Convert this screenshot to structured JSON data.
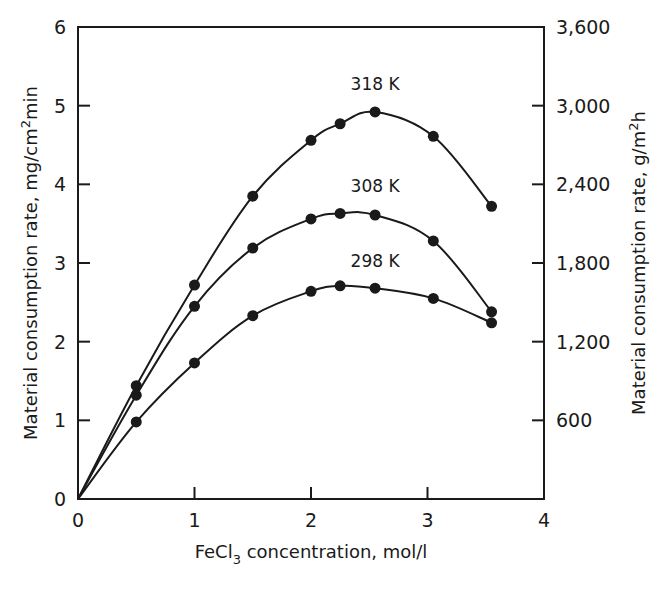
{
  "chart_data": {
    "type": "line",
    "title": "",
    "xlabel": "FeCl3 concentration, mol/l",
    "xlabel_parts": {
      "pre": "FeCl",
      "sub": "3",
      "post": " concentration, mol/l"
    },
    "ylabel": "Material consumption rate, mg/cm2min",
    "ylabel_parts": {
      "pre": "Material consumption rate, mg/cm",
      "sup": "2",
      "post": "min"
    },
    "y2label": "Material consumption rate, g/m2h",
    "y2label_parts": {
      "pre": "Material consumption rate, g/m",
      "sup": "2",
      "post": "h"
    },
    "xlim": [
      0,
      4
    ],
    "ylim": [
      0,
      6
    ],
    "y2lim": [
      0,
      3600
    ],
    "xticks": [
      "0",
      "1",
      "2",
      "3",
      "4"
    ],
    "yticks": [
      "0",
      "1",
      "2",
      "3",
      "4",
      "5",
      "6"
    ],
    "y2ticks": [
      "600",
      "1,200",
      "1,800",
      "2,400",
      "3,000",
      "3,600"
    ],
    "grid": false,
    "legend": "inline labels above curves",
    "series": [
      {
        "name": "318 K",
        "x": [
          0,
          0.5,
          1.0,
          1.5,
          2.0,
          2.25,
          2.55,
          3.05,
          3.55
        ],
        "values": [
          0,
          1.44,
          2.72,
          3.85,
          4.56,
          4.77,
          4.92,
          4.61,
          3.72
        ],
        "label_pos": [
          2.55,
          5.2
        ]
      },
      {
        "name": "308 K",
        "x": [
          0,
          0.5,
          1.0,
          1.5,
          2.0,
          2.25,
          2.55,
          3.05,
          3.55
        ],
        "values": [
          0,
          1.32,
          2.45,
          3.19,
          3.56,
          3.63,
          3.61,
          3.28,
          2.38
        ],
        "label_pos": [
          2.55,
          3.9
        ]
      },
      {
        "name": "298 K",
        "x": [
          0,
          0.5,
          1.0,
          1.5,
          2.0,
          2.25,
          2.55,
          3.05,
          3.55
        ],
        "values": [
          0,
          0.98,
          1.73,
          2.33,
          2.64,
          2.71,
          2.68,
          2.55,
          2.24
        ],
        "label_pos": [
          2.55,
          2.95
        ]
      }
    ]
  }
}
